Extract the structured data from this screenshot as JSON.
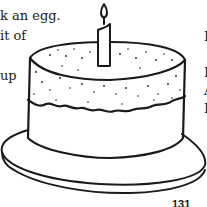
{
  "page": {
    "left_column_lines": [
      "k an egg.",
      "it of",
      "",
      "up"
    ],
    "right_column_lines": [
      "I",
      "",
      "I",
      "A",
      "I"
    ],
    "illustration": "birthday-cake-with-candle",
    "page_number": "131"
  },
  "colors": {
    "ink": "#1a1a1a",
    "paper": "#ffffff"
  }
}
